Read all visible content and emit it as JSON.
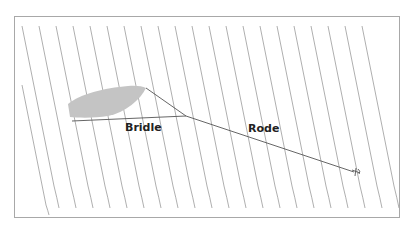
{
  "diagram": {
    "labels": {
      "bridle": "Bridle",
      "rode": "Rode"
    },
    "colors": {
      "waves": "#8c8c8c",
      "boat_fill": "#c4c4c4",
      "lines": "#555555",
      "frame": "#a8a8a8"
    },
    "elements": {
      "boat": "boat-hull-silhouette",
      "bridle": "two lines from bow and stern meeting at junction",
      "rode": "line from bridle junction to anchor",
      "anchor": "anchor-icon",
      "waves": "diagonal-wave-lines"
    }
  }
}
